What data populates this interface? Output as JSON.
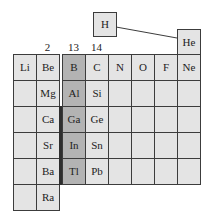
{
  "group_labels": {
    "g2": "2",
    "g13": "13",
    "g14": "14"
  },
  "isolated": {
    "hydrogen": "H",
    "helium": "He"
  },
  "highlight_group": "13",
  "colors": {
    "cell_fill": "#e4e4e4",
    "highlight_fill": "#b3b3b3",
    "line": "#3c3c3c"
  },
  "rows": [
    {
      "period": 2,
      "cells": [
        "Li",
        "Be",
        "B",
        "C",
        "N",
        "O",
        "F",
        "Ne"
      ]
    },
    {
      "period": 3,
      "cells": [
        "",
        "Mg",
        "Al",
        "Si",
        "",
        "",
        "",
        ""
      ]
    },
    {
      "period": 4,
      "cells": [
        "",
        "Ca",
        "Ga",
        "Ge",
        "",
        "",
        "",
        ""
      ]
    },
    {
      "period": 5,
      "cells": [
        "",
        "Sr",
        "In",
        "Sn",
        "",
        "",
        "",
        ""
      ]
    },
    {
      "period": 6,
      "cells": [
        "",
        "Ba",
        "Tl",
        "Pb",
        "",
        "",
        "",
        ""
      ]
    },
    {
      "period": 7,
      "cells": [
        "",
        "Ra"
      ]
    }
  ]
}
